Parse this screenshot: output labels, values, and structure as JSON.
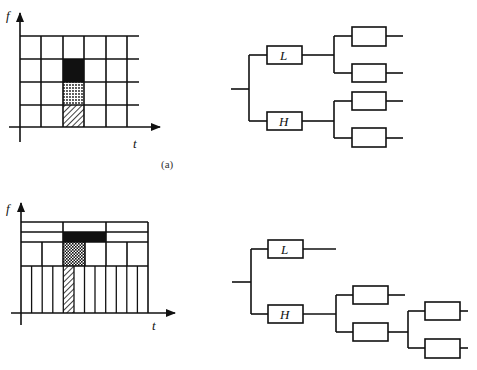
{
  "figure": {
    "caption_a": "(a)",
    "panel_a": {
      "tiling": {
        "freq_axis_label": "f",
        "time_axis_label": "t",
        "description": "uniform 6x4 time-frequency tiling",
        "highlighted_cells": [
          {
            "pattern": "solid-black",
            "col": 3,
            "row": 2
          },
          {
            "pattern": "dotted",
            "col": 3,
            "row": 3
          },
          {
            "pattern": "hatched",
            "col": 3,
            "row": 4
          }
        ]
      },
      "tree": {
        "root_branches": [
          {
            "label": "L",
            "children": [
              "",
              ""
            ]
          },
          {
            "label": "H",
            "children": [
              "",
              ""
            ]
          }
        ]
      }
    },
    "panel_b": {
      "tiling": {
        "freq_axis_label": "f",
        "time_axis_label": "t",
        "description": "wavelet-packet adaptive tiling: 3,3,6,12 divisions per band"
      },
      "tree": {
        "root_branches": [
          {
            "label": "L",
            "children": []
          },
          {
            "label": "H",
            "children": [
              "",
              {
                "label": "",
                "children": [
                  "",
                  ""
                ]
              }
            ]
          }
        ]
      }
    }
  }
}
